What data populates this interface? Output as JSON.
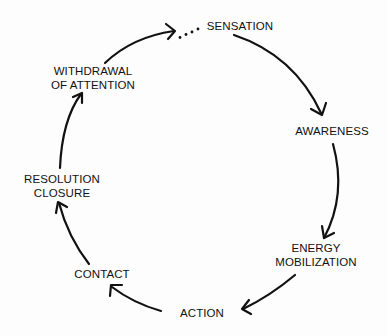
{
  "diagram": {
    "type": "cycle",
    "direction": "clockwise",
    "stroke_color": "#111111",
    "background": "#fdfdfd",
    "stages": [
      {
        "id": "sensation",
        "lines": [
          "SENSATION"
        ]
      },
      {
        "id": "awareness",
        "lines": [
          "AWARENESS"
        ]
      },
      {
        "id": "energy-mobilization",
        "lines": [
          "ENERGY",
          "MOBILIZATION"
        ]
      },
      {
        "id": "action",
        "lines": [
          "ACTION"
        ]
      },
      {
        "id": "contact",
        "lines": [
          "CONTACT"
        ]
      },
      {
        "id": "resolution-closure",
        "lines": [
          "RESOLUTION",
          "CLOSURE"
        ]
      },
      {
        "id": "withdrawal-of-attention",
        "lines": [
          "WITHDRAWAL",
          "OF ATTENTION"
        ]
      }
    ],
    "connections": [
      {
        "from": "withdrawal-of-attention",
        "to": "sensation",
        "style": "arrow-then-dotted"
      },
      {
        "from": "sensation",
        "to": "awareness",
        "style": "arrow"
      },
      {
        "from": "awareness",
        "to": "energy-mobilization",
        "style": "arrow"
      },
      {
        "from": "energy-mobilization",
        "to": "action",
        "style": "arrow"
      },
      {
        "from": "action",
        "to": "contact",
        "style": "arrow"
      },
      {
        "from": "contact",
        "to": "resolution-closure",
        "style": "arrow"
      },
      {
        "from": "resolution-closure",
        "to": "withdrawal-of-attention",
        "style": "arrow"
      }
    ]
  }
}
